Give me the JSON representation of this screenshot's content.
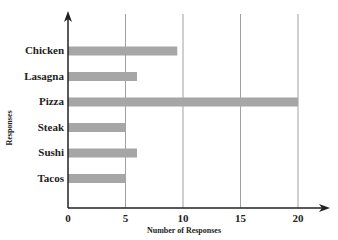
{
  "chart_data": {
    "type": "bar",
    "orientation": "horizontal",
    "title": "",
    "categories": [
      "Chicken",
      "Lasagna",
      "Pizza",
      "Steak",
      "Sushi",
      "Tacos"
    ],
    "values": [
      9.5,
      6,
      20,
      5,
      6,
      5
    ],
    "xlabel": "Number of Responses",
    "ylabel": "Responses",
    "xlim": [
      0,
      22
    ],
    "x_ticks": [
      "0",
      "5",
      "10",
      "15",
      "20"
    ],
    "grid": "vertical",
    "legend": "none",
    "bar_color": "#a6a6a6"
  },
  "labels": {
    "xlabel": "Number of Responses",
    "ylabel": "Responses",
    "categories": [
      "Chicken",
      "Lasagna",
      "Pizza",
      "Steak",
      "Sushi",
      "Tacos"
    ],
    "ticks": [
      "0",
      "5",
      "10",
      "15",
      "20"
    ]
  }
}
